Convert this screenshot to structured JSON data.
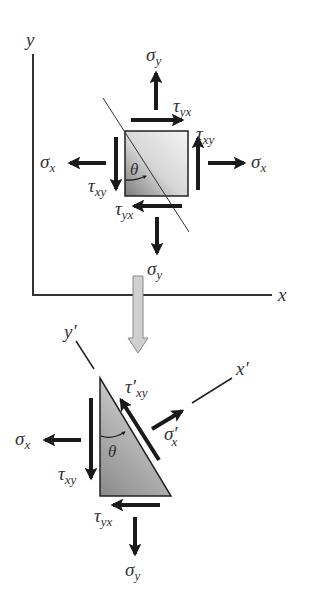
{
  "figure": {
    "upper_element": {
      "axes": {
        "x_label": "x",
        "y_label": "y"
      },
      "angle_label": "θ",
      "labels": {
        "sigma_y_top": {
          "sym": "σ",
          "sub": "y"
        },
        "tau_yx_top": {
          "sym": "τ",
          "sub": "yx"
        },
        "tau_xy_right": {
          "sym": "τ",
          "sub": "xy"
        },
        "sigma_x_right": {
          "sym": "σ",
          "sub": "x"
        },
        "sigma_x_left": {
          "sym": "σ",
          "sub": "x"
        },
        "tau_xy_left": {
          "sym": "τ",
          "sub": "xy"
        },
        "tau_yx_bottom": {
          "sym": "τ",
          "sub": "yx"
        },
        "sigma_y_bottom": {
          "sym": "σ",
          "sub": "y"
        }
      }
    },
    "transition_arrow": "down-arrow",
    "lower_element": {
      "axes": {
        "x_prime_label": "x′",
        "y_prime_label": "y′"
      },
      "angle_label": "θ",
      "labels": {
        "tau_prime_xy": {
          "sym": "τ′",
          "sub": "xy"
        },
        "sigma_prime_x": {
          "sym": "σ′",
          "sub": "x"
        },
        "sigma_x_left": {
          "sym": "σ",
          "sub": "x"
        },
        "tau_xy_left": {
          "sym": "τ",
          "sub": "xy"
        },
        "tau_yx_bottom": {
          "sym": "τ",
          "sub": "yx"
        },
        "sigma_y_bottom": {
          "sym": "σ",
          "sub": "y"
        }
      }
    },
    "colors": {
      "arrow": "#1a1a1a",
      "axis": "#333333",
      "square_light": "#f2f2f2",
      "square_dark": "#7a7a7a",
      "transition_arrow_fill": "#d0d0d0"
    }
  }
}
